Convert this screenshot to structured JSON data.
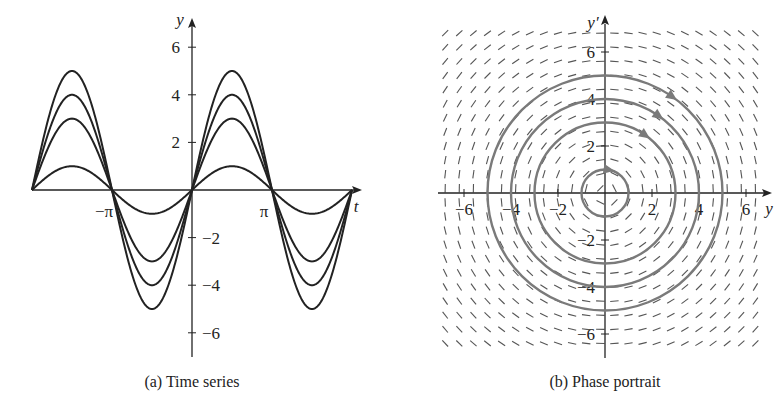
{
  "chart_data": [
    {
      "type": "line",
      "title": "",
      "caption": "(a)  Time series",
      "xlabel": "t",
      "ylabel": "y",
      "xlim": [
        -6.2832,
        6.2832
      ],
      "ylim": [
        -7,
        7
      ],
      "x_ticks": [
        {
          "value": -3.1416,
          "label": "−π"
        },
        {
          "value": 3.1416,
          "label": "π"
        }
      ],
      "y_ticks": [
        {
          "value": 6,
          "label": "6"
        },
        {
          "value": 4,
          "label": "4"
        },
        {
          "value": 2,
          "label": "2"
        },
        {
          "value": -2,
          "label": "−2"
        },
        {
          "value": -4,
          "label": "−4"
        },
        {
          "value": -6,
          "label": "−6"
        }
      ],
      "series": [
        {
          "name": "y = 1·sin(t)",
          "amplitude": 1
        },
        {
          "name": "y = 3·sin(t)",
          "amplitude": 3
        },
        {
          "name": "y = 4·sin(t)",
          "amplitude": 4
        },
        {
          "name": "y = 5·sin(t)",
          "amplitude": 5
        }
      ],
      "grid": false,
      "legend": "none",
      "line_color": "#222222"
    },
    {
      "type": "scatter",
      "subtype": "phase-portrait",
      "title": "",
      "caption": "(b)  Phase portrait",
      "xlabel": "y",
      "ylabel": "y′",
      "xlim": [
        -7,
        7
      ],
      "ylim": [
        -7,
        7
      ],
      "x_ticks": [
        {
          "value": -6,
          "label": "−6"
        },
        {
          "value": -4,
          "label": "−4"
        },
        {
          "value": -2,
          "label": "−2"
        },
        {
          "value": 2,
          "label": "2"
        },
        {
          "value": 4,
          "label": "4"
        },
        {
          "value": 6,
          "label": "6"
        }
      ],
      "y_ticks": [
        {
          "value": 6,
          "label": "6"
        },
        {
          "value": 4,
          "label": "4"
        },
        {
          "value": 2,
          "label": "2"
        },
        {
          "value": -2,
          "label": "−2"
        },
        {
          "value": -4,
          "label": "−4"
        },
        {
          "value": -6,
          "label": "−6"
        }
      ],
      "direction_field": {
        "system": "y' = v, v' = -y",
        "spacing": 0.6
      },
      "trajectories": [
        {
          "shape": "circle",
          "radius": 1,
          "direction": "clockwise"
        },
        {
          "shape": "circle",
          "radius": 3,
          "direction": "clockwise"
        },
        {
          "shape": "circle",
          "radius": 4,
          "direction": "clockwise"
        },
        {
          "shape": "circle",
          "radius": 5,
          "direction": "clockwise"
        }
      ],
      "trajectory_color": "#7a7a7a",
      "field_color": "#555555",
      "grid": false,
      "legend": "none"
    }
  ]
}
